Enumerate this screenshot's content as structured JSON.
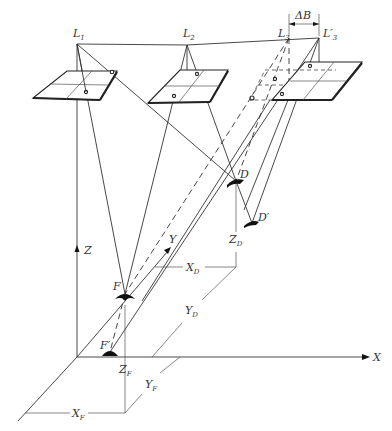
{
  "diagram": {
    "type": "photogrammetry-geometry",
    "labels": {
      "L1": {
        "main": "L",
        "sub": "1"
      },
      "L2": {
        "main": "L",
        "sub": "2"
      },
      "L3": {
        "main": "L",
        "sub": "3"
      },
      "L3p": {
        "main": "L′",
        "sub": "3"
      },
      "deltaB": "ΔB",
      "D": "D",
      "Dp": "D′",
      "F": "F",
      "Fp": "F′",
      "Z": "Z",
      "Y": "Y",
      "X": "X",
      "XD": {
        "main": "X",
        "sub": "D"
      },
      "YD": {
        "main": "Y",
        "sub": "D"
      },
      "ZD": {
        "main": "Z",
        "sub": "D"
      },
      "XF": {
        "main": "X",
        "sub": "F"
      },
      "YF": {
        "main": "Y",
        "sub": "F"
      },
      "ZF": {
        "main": "Z",
        "sub": "F"
      }
    },
    "colors": {
      "line": "#333333",
      "background": "#ffffff"
    }
  }
}
